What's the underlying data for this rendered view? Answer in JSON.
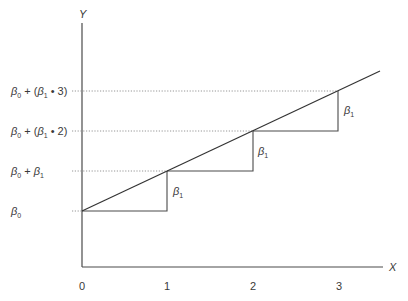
{
  "diagram": {
    "type": "regression-step-diagram",
    "axes": {
      "x_label": "X",
      "y_label": "Y",
      "x_ticks": [
        "0",
        "1",
        "2",
        "3"
      ]
    },
    "y_levels": [
      {
        "sym": "β",
        "sub": "0",
        "rest": "",
        "label_text": "β0"
      },
      {
        "sym": "β",
        "sub": "0",
        "rest": " + ",
        "sym2": "β",
        "sub2": "1",
        "tail": "",
        "label_text": "β0 + β1"
      },
      {
        "sym": "β",
        "sub": "0",
        "rest": " + (",
        "sym2": "β",
        "sub2": "1",
        "tail": " • 2)",
        "label_text": "β0 + (β1 • 2)"
      },
      {
        "sym": "β",
        "sub": "0",
        "rest": " + (",
        "sym2": "β",
        "sub2": "1",
        "tail": " • 3)",
        "label_text": "β0 + (β1 • 3)"
      }
    ],
    "step_labels": [
      {
        "sym": "β",
        "sub": "1"
      },
      {
        "sym": "β",
        "sub": "1"
      },
      {
        "sym": "β",
        "sub": "1"
      }
    ]
  }
}
